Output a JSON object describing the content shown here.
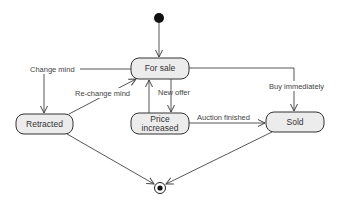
{
  "diagram": {
    "type": "UML state diagram",
    "initial_node": {
      "label": "initial"
    },
    "final_node": {
      "label": "final"
    },
    "states": {
      "for_sale": "For sale",
      "retracted": "Retracted",
      "price_increased_line1": "Price",
      "price_increased_line2": "increased",
      "sold": "Sold"
    },
    "transitions": {
      "change_mind": "Change mind",
      "re_change_mind": "Re-change mind",
      "new_offer": "New offer",
      "auction_finished": "Auction finished",
      "buy_immediately": "Buy immediately"
    },
    "colors": {
      "state_fill": "#ececec",
      "stroke": "#333333",
      "background": "#ffffff"
    }
  }
}
